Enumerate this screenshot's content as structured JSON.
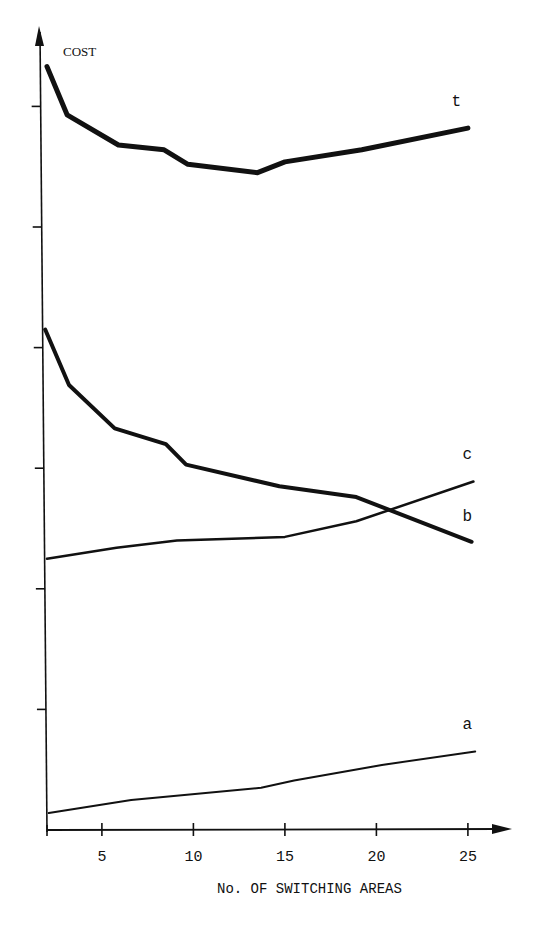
{
  "chart_data": {
    "type": "line",
    "title": "",
    "xlabel": "No. OF SWITCHING AREAS",
    "ylabel": "COST",
    "xlim": [
      2,
      26.5
    ],
    "ylim": [
      0,
      6.6
    ],
    "x_ticks": [
      5,
      10,
      15,
      20,
      25
    ],
    "x_tick_labels": [
      "5",
      "10",
      "15",
      "20",
      "25"
    ],
    "y_ticks": [
      1,
      2,
      3,
      4,
      5,
      6
    ],
    "y_tick_labels": [],
    "grid": false,
    "legend": "inline labels at right end of each curve",
    "series": [
      {
        "name": "t",
        "stroke_width": 5,
        "points": [
          [
            2.0,
            6.33
          ],
          [
            3.1,
            5.93
          ],
          [
            5.9,
            5.68
          ],
          [
            8.4,
            5.64
          ],
          [
            9.7,
            5.52
          ],
          [
            13.5,
            5.45
          ],
          [
            15.0,
            5.54
          ],
          [
            19.2,
            5.64
          ],
          [
            25.0,
            5.82
          ]
        ],
        "label_pos": [
          24.1,
          6.0
        ]
      },
      {
        "name": "b",
        "stroke_width": 4,
        "points": [
          [
            1.9,
            4.15
          ],
          [
            3.2,
            3.69
          ],
          [
            5.7,
            3.33
          ],
          [
            8.5,
            3.2
          ],
          [
            9.6,
            3.03
          ],
          [
            14.7,
            2.85
          ],
          [
            18.9,
            2.76
          ],
          [
            25.2,
            2.39
          ]
        ],
        "label_pos": [
          24.7,
          2.56
        ]
      },
      {
        "name": "c",
        "stroke_width": 2.5,
        "points": [
          [
            2.0,
            2.25
          ],
          [
            5.8,
            2.34
          ],
          [
            9.1,
            2.4
          ],
          [
            15.0,
            2.43
          ],
          [
            18.9,
            2.56
          ],
          [
            25.3,
            2.89
          ]
        ],
        "label_pos": [
          24.7,
          3.08
        ]
      },
      {
        "name": "a",
        "stroke_width": 2,
        "points": [
          [
            2.1,
            0.14
          ],
          [
            6.6,
            0.25
          ],
          [
            13.7,
            0.35
          ],
          [
            15.5,
            0.41
          ],
          [
            20.3,
            0.54
          ],
          [
            25.4,
            0.65
          ]
        ],
        "label_pos": [
          24.7,
          0.84
        ]
      }
    ]
  },
  "labels": {
    "y_axis": "COST",
    "x_axis": "No. OF SWITCHING AREAS"
  },
  "colors": {
    "ink": "#111111",
    "background": "#ffffff"
  }
}
